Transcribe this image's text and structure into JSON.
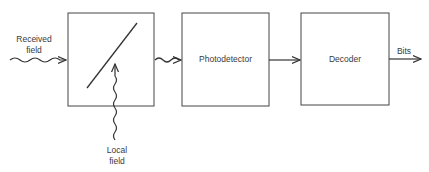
{
  "diagram": {
    "input_label": [
      "Received",
      "field"
    ],
    "local_label": [
      "Local",
      "field"
    ],
    "blocks": [
      {
        "id": "mixer",
        "label": ""
      },
      {
        "id": "photodetector",
        "label": "Photodetector"
      },
      {
        "id": "decoder",
        "label": "Decoder"
      }
    ],
    "output_label": "Bits",
    "colors": {
      "stroke": "#333333",
      "background": "#ffffff"
    }
  }
}
